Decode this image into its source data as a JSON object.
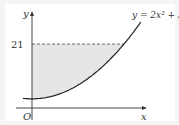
{
  "diagram": {
    "equation_label": "y = 2x² + 3",
    "y_axis_label": "y",
    "x_axis_label": "x",
    "origin_label": "O",
    "y_marker_label": "21",
    "function": {
      "a": 2,
      "c": 3
    },
    "y_marker_value": 21,
    "shaded_region": "between curve, y-axis and y = 21",
    "colors": {
      "curve": "#222222",
      "shade": "#e6e6e6",
      "axis": "#333333",
      "dash": "#444444"
    }
  }
}
